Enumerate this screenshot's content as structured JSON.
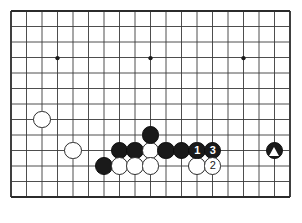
{
  "diagram": {
    "kind": "go-board-diagram",
    "board": {
      "left": 11,
      "top": 11,
      "cell": 15.5,
      "cols": 19,
      "rows": 13,
      "line_color": "#3a3a3a",
      "edge_color": "#2b2b2b",
      "background": "#ffffff",
      "star_points": [
        {
          "col": 3,
          "row": 3
        },
        {
          "col": 9,
          "row": 3
        },
        {
          "col": 15,
          "row": 3
        }
      ]
    },
    "stones": [
      {
        "id": "w-a",
        "color": "white",
        "col": 2,
        "row": 7,
        "label": "",
        "marker": ""
      },
      {
        "id": "w-b",
        "color": "white",
        "col": 4,
        "row": 9,
        "label": "",
        "marker": ""
      },
      {
        "id": "b-a",
        "color": "black",
        "col": 6,
        "row": 10,
        "label": "",
        "marker": ""
      },
      {
        "id": "b-b",
        "color": "black",
        "col": 7,
        "row": 9,
        "label": "",
        "marker": ""
      },
      {
        "id": "b-c",
        "color": "black",
        "col": 8,
        "row": 9,
        "label": "",
        "marker": ""
      },
      {
        "id": "w-c",
        "color": "white",
        "col": 9,
        "row": 9,
        "label": "",
        "marker": ""
      },
      {
        "id": "b-d",
        "color": "black",
        "col": 9,
        "row": 8,
        "label": "",
        "marker": ""
      },
      {
        "id": "b-e",
        "color": "black",
        "col": 10,
        "row": 9,
        "label": "",
        "marker": ""
      },
      {
        "id": "b-f",
        "color": "black",
        "col": 11,
        "row": 9,
        "label": "",
        "marker": ""
      },
      {
        "id": "b-1",
        "color": "black",
        "col": 12,
        "row": 9,
        "label": "1",
        "marker": ""
      },
      {
        "id": "b-3",
        "color": "black",
        "col": 13,
        "row": 9,
        "label": "3",
        "marker": ""
      },
      {
        "id": "w-d",
        "color": "white",
        "col": 7,
        "row": 10,
        "label": "",
        "marker": ""
      },
      {
        "id": "w-e",
        "color": "white",
        "col": 8,
        "row": 10,
        "label": "",
        "marker": ""
      },
      {
        "id": "w-f",
        "color": "white",
        "col": 9,
        "row": 10,
        "label": "",
        "marker": ""
      },
      {
        "id": "w-g",
        "color": "white",
        "col": 12,
        "row": 10,
        "label": "",
        "marker": ""
      },
      {
        "id": "w-2",
        "color": "white",
        "col": 13,
        "row": 10,
        "label": "2",
        "marker": ""
      },
      {
        "id": "b-tri",
        "color": "black",
        "col": 17,
        "row": 9,
        "label": "",
        "marker": "triangle"
      }
    ],
    "move_numbers": [
      "1",
      "2",
      "3"
    ],
    "marker_glyph": "triangle"
  }
}
